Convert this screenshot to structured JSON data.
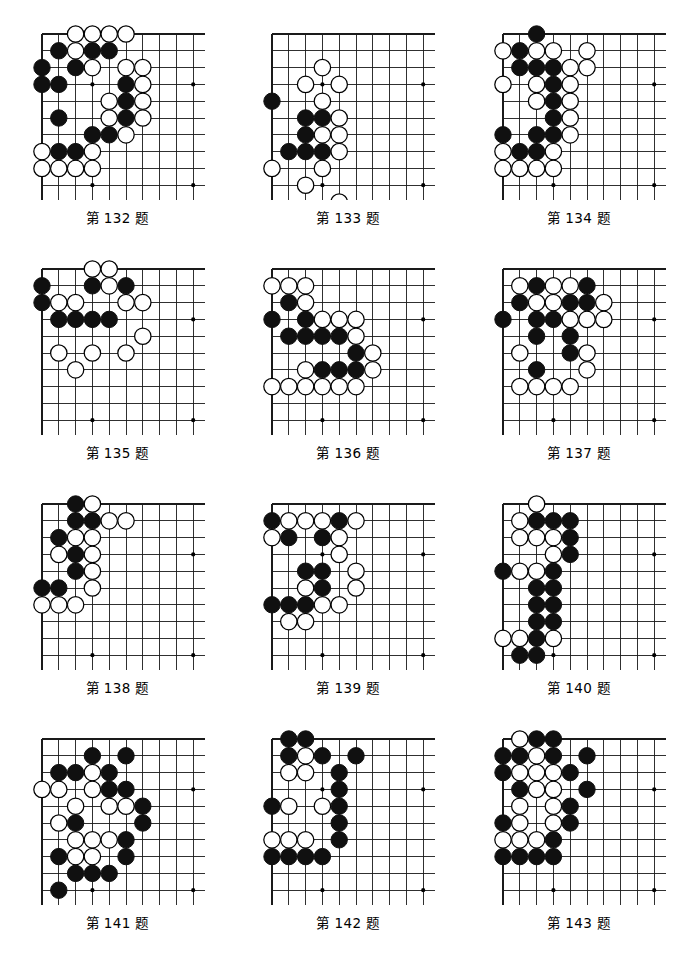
{
  "page": {
    "caption_prefix": "第",
    "caption_suffix": "题",
    "columns": 3,
    "rows": 4
  },
  "board_style": {
    "line_color": "#1a1a1a",
    "edge_color": "#000000",
    "black_stone_color": "#101010",
    "white_stone_fill": "#ffffff",
    "white_stone_stroke": "#000000",
    "background": "#ffffff",
    "cols": 11,
    "rows": 11,
    "spacing": 16.8,
    "origin_x": 12,
    "origin_y": 12,
    "stone_radius": 8.2,
    "star_points": [
      [
        3,
        3
      ],
      [
        3,
        9
      ],
      [
        9,
        3
      ],
      [
        9,
        9
      ]
    ]
  },
  "problems": [
    {
      "number": "132",
      "caption": "第 132 题",
      "black": [
        [
          1,
          1
        ],
        [
          3,
          1
        ],
        [
          4,
          1
        ],
        [
          0,
          2
        ],
        [
          2,
          2
        ],
        [
          0,
          3
        ],
        [
          1,
          3
        ],
        [
          5,
          3
        ],
        [
          5,
          4
        ],
        [
          1,
          5
        ],
        [
          5,
          5
        ],
        [
          3,
          6
        ],
        [
          4,
          6
        ],
        [
          1,
          7
        ],
        [
          2,
          7
        ]
      ],
      "white": [
        [
          2,
          0
        ],
        [
          3,
          0
        ],
        [
          4,
          0
        ],
        [
          5,
          0
        ],
        [
          2,
          1
        ],
        [
          3,
          2
        ],
        [
          5,
          2
        ],
        [
          6,
          2
        ],
        [
          6,
          3
        ],
        [
          4,
          4
        ],
        [
          6,
          4
        ],
        [
          4,
          5
        ],
        [
          6,
          5
        ],
        [
          5,
          6
        ],
        [
          0,
          7
        ],
        [
          3,
          7
        ],
        [
          0,
          8
        ],
        [
          1,
          8
        ],
        [
          2,
          8
        ],
        [
          3,
          8
        ]
      ]
    },
    {
      "number": "133",
      "caption": "第 133 题",
      "black": [
        [
          0,
          4
        ],
        [
          2,
          5
        ],
        [
          3,
          5
        ],
        [
          2,
          6
        ],
        [
          1,
          7
        ],
        [
          2,
          7
        ],
        [
          3,
          7
        ]
      ],
      "white": [
        [
          3,
          2
        ],
        [
          2,
          3
        ],
        [
          4,
          3
        ],
        [
          3,
          4
        ],
        [
          4,
          5
        ],
        [
          4,
          6
        ],
        [
          3,
          6
        ],
        [
          4,
          7
        ],
        [
          0,
          8
        ],
        [
          3,
          8
        ],
        [
          2,
          9
        ],
        [
          4,
          10
        ]
      ]
    },
    {
      "number": "134",
      "caption": "第 134 题",
      "black": [
        [
          2,
          0
        ],
        [
          1,
          1
        ],
        [
          1,
          2
        ],
        [
          2,
          2
        ],
        [
          3,
          2
        ],
        [
          3,
          3
        ],
        [
          3,
          4
        ],
        [
          3,
          5
        ],
        [
          0,
          6
        ],
        [
          2,
          6
        ],
        [
          3,
          6
        ],
        [
          1,
          7
        ],
        [
          2,
          7
        ]
      ],
      "white": [
        [
          0,
          1
        ],
        [
          2,
          1
        ],
        [
          3,
          1
        ],
        [
          5,
          1
        ],
        [
          4,
          2
        ],
        [
          5,
          2
        ],
        [
          0,
          3
        ],
        [
          2,
          3
        ],
        [
          4,
          3
        ],
        [
          2,
          4
        ],
        [
          4,
          4
        ],
        [
          4,
          5
        ],
        [
          4,
          6
        ],
        [
          0,
          7
        ],
        [
          3,
          7
        ],
        [
          0,
          8
        ],
        [
          1,
          8
        ],
        [
          2,
          8
        ],
        [
          3,
          8
        ]
      ]
    },
    {
      "number": "135",
      "caption": "第 135 题",
      "black": [
        [
          0,
          1
        ],
        [
          3,
          1
        ],
        [
          5,
          1
        ],
        [
          0,
          2
        ],
        [
          1,
          3
        ],
        [
          2,
          3
        ],
        [
          3,
          3
        ],
        [
          4,
          3
        ]
      ],
      "white": [
        [
          3,
          0
        ],
        [
          4,
          0
        ],
        [
          4,
          1
        ],
        [
          1,
          2
        ],
        [
          2,
          2
        ],
        [
          5,
          2
        ],
        [
          6,
          2
        ],
        [
          6,
          4
        ],
        [
          1,
          5
        ],
        [
          3,
          5
        ],
        [
          5,
          5
        ],
        [
          2,
          6
        ]
      ]
    },
    {
      "number": "136",
      "caption": "第 136 题",
      "black": [
        [
          1,
          2
        ],
        [
          0,
          3
        ],
        [
          2,
          3
        ],
        [
          1,
          4
        ],
        [
          2,
          4
        ],
        [
          3,
          4
        ],
        [
          4,
          4
        ],
        [
          5,
          5
        ],
        [
          3,
          6
        ],
        [
          4,
          6
        ],
        [
          5,
          6
        ]
      ],
      "white": [
        [
          0,
          1
        ],
        [
          1,
          1
        ],
        [
          2,
          1
        ],
        [
          2,
          2
        ],
        [
          3,
          3
        ],
        [
          4,
          3
        ],
        [
          5,
          3
        ],
        [
          5,
          4
        ],
        [
          6,
          5
        ],
        [
          2,
          6
        ],
        [
          6,
          6
        ],
        [
          0,
          7
        ],
        [
          1,
          7
        ],
        [
          2,
          7
        ],
        [
          3,
          7
        ],
        [
          4,
          7
        ],
        [
          5,
          7
        ]
      ]
    },
    {
      "number": "137",
      "caption": "第 137 题",
      "black": [
        [
          2,
          1
        ],
        [
          5,
          1
        ],
        [
          1,
          2
        ],
        [
          4,
          2
        ],
        [
          5,
          2
        ],
        [
          0,
          3
        ],
        [
          2,
          3
        ],
        [
          3,
          3
        ],
        [
          2,
          4
        ],
        [
          4,
          4
        ],
        [
          4,
          5
        ],
        [
          2,
          6
        ]
      ],
      "white": [
        [
          1,
          1
        ],
        [
          3,
          1
        ],
        [
          4,
          1
        ],
        [
          2,
          2
        ],
        [
          3,
          2
        ],
        [
          6,
          2
        ],
        [
          4,
          3
        ],
        [
          5,
          3
        ],
        [
          6,
          3
        ],
        [
          1,
          5
        ],
        [
          5,
          5
        ],
        [
          5,
          6
        ],
        [
          1,
          7
        ],
        [
          2,
          7
        ],
        [
          3,
          7
        ],
        [
          4,
          7
        ]
      ]
    },
    {
      "number": "138",
      "caption": "第 138 题",
      "black": [
        [
          2,
          0
        ],
        [
          2,
          1
        ],
        [
          3,
          1
        ],
        [
          1,
          2
        ],
        [
          2,
          3
        ],
        [
          2,
          4
        ],
        [
          0,
          5
        ],
        [
          1,
          5
        ]
      ],
      "white": [
        [
          3,
          0
        ],
        [
          4,
          1
        ],
        [
          5,
          1
        ],
        [
          2,
          2
        ],
        [
          3,
          2
        ],
        [
          1,
          3
        ],
        [
          3,
          3
        ],
        [
          3,
          4
        ],
        [
          3,
          5
        ],
        [
          0,
          6
        ],
        [
          1,
          6
        ],
        [
          2,
          6
        ]
      ]
    },
    {
      "number": "139",
      "caption": "第 139 题",
      "black": [
        [
          0,
          1
        ],
        [
          4,
          1
        ],
        [
          1,
          2
        ],
        [
          3,
          2
        ],
        [
          2,
          4
        ],
        [
          3,
          4
        ],
        [
          3,
          5
        ],
        [
          0,
          6
        ],
        [
          1,
          6
        ],
        [
          2,
          6
        ]
      ],
      "white": [
        [
          1,
          1
        ],
        [
          2,
          1
        ],
        [
          3,
          1
        ],
        [
          5,
          1
        ],
        [
          0,
          2
        ],
        [
          4,
          2
        ],
        [
          4,
          3
        ],
        [
          5,
          4
        ],
        [
          2,
          5
        ],
        [
          5,
          5
        ],
        [
          4,
          6
        ],
        [
          3,
          6
        ],
        [
          1,
          7
        ],
        [
          2,
          7
        ]
      ]
    },
    {
      "number": "140",
      "caption": "第 140 题",
      "black": [
        [
          2,
          1
        ],
        [
          3,
          1
        ],
        [
          4,
          1
        ],
        [
          4,
          2
        ],
        [
          4,
          3
        ],
        [
          0,
          4
        ],
        [
          3,
          4
        ],
        [
          2,
          5
        ],
        [
          3,
          5
        ],
        [
          2,
          6
        ],
        [
          3,
          6
        ],
        [
          2,
          7
        ],
        [
          3,
          7
        ],
        [
          2,
          8
        ],
        [
          1,
          9
        ],
        [
          2,
          9
        ]
      ],
      "white": [
        [
          2,
          0
        ],
        [
          1,
          1
        ],
        [
          1,
          2
        ],
        [
          2,
          2
        ],
        [
          3,
          2
        ],
        [
          3,
          3
        ],
        [
          1,
          4
        ],
        [
          2,
          4
        ],
        [
          3,
          8
        ],
        [
          0,
          8
        ],
        [
          1,
          8
        ]
      ]
    },
    {
      "number": "141",
      "caption": "第 141 题",
      "black": [
        [
          3,
          1
        ],
        [
          5,
          1
        ],
        [
          1,
          2
        ],
        [
          2,
          2
        ],
        [
          4,
          2
        ],
        [
          4,
          3
        ],
        [
          5,
          3
        ],
        [
          6,
          4
        ],
        [
          2,
          5
        ],
        [
          6,
          5
        ],
        [
          5,
          6
        ],
        [
          1,
          7
        ],
        [
          5,
          7
        ],
        [
          2,
          8
        ],
        [
          3,
          8
        ],
        [
          4,
          8
        ],
        [
          1,
          9
        ]
      ],
      "white": [
        [
          3,
          2
        ],
        [
          0,
          3
        ],
        [
          1,
          3
        ],
        [
          3,
          3
        ],
        [
          2,
          4
        ],
        [
          4,
          4
        ],
        [
          5,
          4
        ],
        [
          1,
          5
        ],
        [
          3,
          6
        ],
        [
          4,
          6
        ],
        [
          2,
          7
        ],
        [
          3,
          7
        ],
        [
          2,
          6
        ]
      ]
    },
    {
      "number": "142",
      "caption": "第 142 题",
      "black": [
        [
          1,
          0
        ],
        [
          2,
          0
        ],
        [
          1,
          1
        ],
        [
          3,
          1
        ],
        [
          5,
          1
        ],
        [
          4,
          2
        ],
        [
          4,
          3
        ],
        [
          0,
          4
        ],
        [
          4,
          4
        ],
        [
          4,
          5
        ],
        [
          4,
          6
        ],
        [
          0,
          7
        ],
        [
          1,
          7
        ],
        [
          2,
          7
        ],
        [
          3,
          7
        ]
      ],
      "white": [
        [
          2,
          1
        ],
        [
          1,
          2
        ],
        [
          2,
          2
        ],
        [
          1,
          4
        ],
        [
          3,
          4
        ],
        [
          0,
          6
        ],
        [
          1,
          6
        ],
        [
          2,
          6
        ]
      ]
    },
    {
      "number": "143",
      "caption": "第 143 题",
      "black": [
        [
          2,
          0
        ],
        [
          3,
          0
        ],
        [
          0,
          1
        ],
        [
          1,
          1
        ],
        [
          3,
          1
        ],
        [
          5,
          1
        ],
        [
          0,
          2
        ],
        [
          4,
          2
        ],
        [
          1,
          3
        ],
        [
          5,
          3
        ],
        [
          4,
          4
        ],
        [
          0,
          5
        ],
        [
          4,
          5
        ],
        [
          3,
          6
        ],
        [
          0,
          7
        ],
        [
          1,
          7
        ],
        [
          2,
          7
        ],
        [
          3,
          7
        ]
      ],
      "white": [
        [
          1,
          0
        ],
        [
          2,
          1
        ],
        [
          1,
          2
        ],
        [
          2,
          2
        ],
        [
          3,
          2
        ],
        [
          2,
          3
        ],
        [
          3,
          3
        ],
        [
          1,
          4
        ],
        [
          3,
          4
        ],
        [
          1,
          5
        ],
        [
          3,
          5
        ],
        [
          0,
          6
        ],
        [
          1,
          6
        ],
        [
          2,
          6
        ]
      ]
    }
  ]
}
